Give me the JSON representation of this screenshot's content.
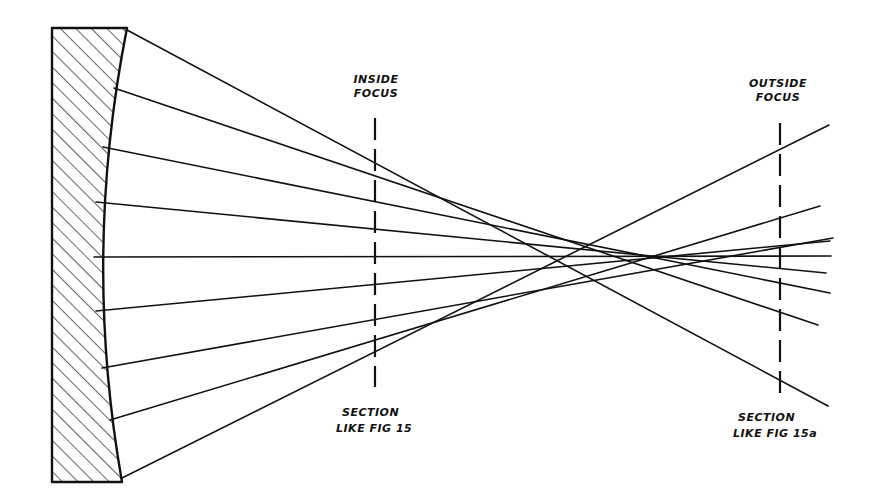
{
  "diagram": {
    "title": "",
    "labels": {
      "inside_focus": [
        "INSIDE",
        "FOCUS"
      ],
      "outside_focus": [
        "OUTSIDE",
        "FOCUS"
      ],
      "inside_section": [
        "SECTION",
        "LIKE FIG 15"
      ],
      "outside_section": [
        "SECTION",
        "LIKE FIG 15a"
      ]
    },
    "mirror": {
      "type": "concave-mirror",
      "hatched": true,
      "back_x": 52,
      "top_y": 28,
      "bottom_y": 482,
      "top_face_x": 127,
      "mid_face_x": 94,
      "bottom_face_x": 122
    },
    "focus_lines": [
      {
        "name": "inside-focus-line",
        "x": 375,
        "y1": 118,
        "y2": 387
      },
      {
        "name": "outside-focus-line",
        "x": 780,
        "y1": 123,
        "y2": 398
      }
    ],
    "rays": [
      {
        "from": [
          127,
          30
        ],
        "to": [
          828,
          406
        ]
      },
      {
        "from": [
          114,
          88
        ],
        "to": [
          818,
          325
        ]
      },
      {
        "from": [
          103,
          147
        ],
        "to": [
          830,
          293
        ]
      },
      {
        "from": [
          96,
          202
        ],
        "to": [
          826,
          273
        ]
      },
      {
        "from": [
          94,
          257
        ],
        "to": [
          831,
          256
        ]
      },
      {
        "from": [
          96,
          311
        ],
        "to": [
          830,
          241
        ]
      },
      {
        "from": [
          102,
          368
        ],
        "to": [
          833,
          238
        ]
      },
      {
        "from": [
          110,
          420
        ],
        "to": [
          820,
          206
        ]
      },
      {
        "from": [
          122,
          478
        ],
        "to": [
          829,
          125
        ]
      }
    ],
    "colors": {
      "ink": "#111111",
      "background": "#ffffff"
    }
  }
}
